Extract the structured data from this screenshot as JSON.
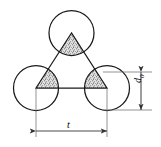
{
  "figure": {
    "background_color": "#ffffff",
    "stroke_color": "#1a1a1a",
    "dimension_line_color": "#4d4d4d",
    "stipple_fill_color": "#9a9a9a",
    "width_px": 161,
    "height_px": 147
  },
  "labels": {
    "horizontal_dimension": "t",
    "vertical_dimension_base": "d",
    "vertical_dimension_subscript": "0"
  },
  "geometry": {
    "circles": [
      {
        "name": "top-particle",
        "cx": 71.5,
        "cy": 33.0,
        "r": 22.5
      },
      {
        "name": "left-particle",
        "cx": 36.0,
        "cy": 88.0,
        "r": 22.5
      },
      {
        "name": "right-particle",
        "cx": 107.0,
        "cy": 88.0,
        "r": 22.5
      }
    ],
    "triangle_vertices": [
      {
        "x": 71.5,
        "y": 33.0
      },
      {
        "x": 36.0,
        "y": 88.0
      },
      {
        "x": 107.0,
        "y": 88.0
      }
    ],
    "horizontal_dimension_line": {
      "x1": 36.0,
      "x2": 107.0,
      "y": 131.0
    },
    "vertical_dimension_line": {
      "x": 141.0,
      "y1": 72.0,
      "y2": 110.0
    }
  },
  "icons": {
    "arrow_head": "arrow-head-icon",
    "stipple": "stipple-fill-icon"
  }
}
